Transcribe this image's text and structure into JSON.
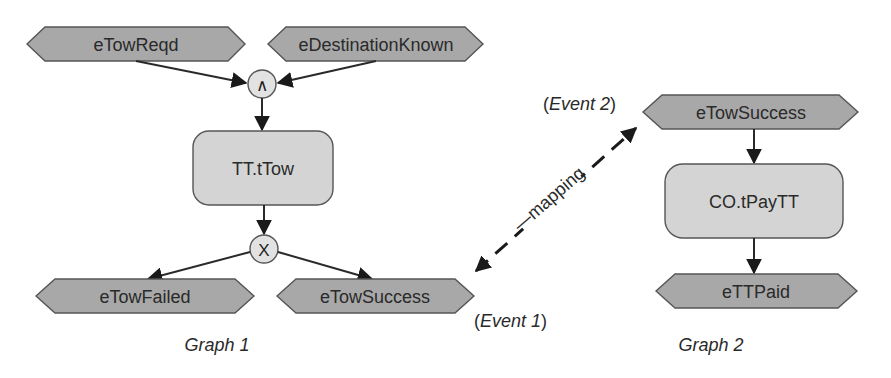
{
  "graph1": {
    "caption": "Graph 1",
    "inputs": [
      {
        "label": "eTowReqd"
      },
      {
        "label": "eDestinationKnown"
      }
    ],
    "join_gate": {
      "symbol": "∧",
      "type": "AND"
    },
    "task": {
      "label": "TT.tTow"
    },
    "split_gate": {
      "symbol": "X",
      "type": "XOR"
    },
    "outputs": [
      {
        "label": "eTowFailed"
      },
      {
        "label": "eTowSuccess"
      }
    ],
    "event_annotation": {
      "open": "(",
      "name": "Event 1",
      "close": ")"
    }
  },
  "graph2": {
    "caption": "Graph 2",
    "input": {
      "label": "eTowSuccess"
    },
    "task": {
      "label": "CO.tPayTT"
    },
    "output": {
      "label": "eTTPaid"
    },
    "event_annotation": {
      "open": "(",
      "name": "Event 2",
      "close": ")"
    }
  },
  "mapping": {
    "label": "—mapping"
  },
  "colors": {
    "event_fill": "#a8a8a8",
    "task_fill": "#d4d4d4",
    "gate_fill": "#e2e2e2",
    "stroke": "#555555",
    "edge": "#2a2a2a"
  }
}
